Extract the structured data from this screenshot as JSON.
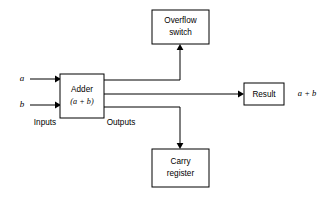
{
  "diagram": {
    "background_color": "#ffffff",
    "line_color": "#000000",
    "nodes": [
      {
        "id": "overflow",
        "name": "overflow-switch-box",
        "label_line1": "Overflow",
        "label_line2": "switch",
        "x": 152,
        "y": 10,
        "width": 57,
        "height": 34
      },
      {
        "id": "adder",
        "name": "adder-box",
        "label_line1": "Adder",
        "label_line2": "(a + b)",
        "x": 60,
        "y": 74,
        "width": 44,
        "height": 44
      },
      {
        "id": "result",
        "name": "result-box",
        "label_line1": "Result",
        "label_line2": "",
        "x": 244,
        "y": 83,
        "width": 40,
        "height": 22
      },
      {
        "id": "carry",
        "name": "carry-register-box",
        "label_line1": "Carry",
        "label_line2": "register",
        "x": 152,
        "y": 149,
        "width": 57,
        "height": 38
      }
    ],
    "input_signals": [
      {
        "id": "a",
        "label": "a",
        "label_x": 22,
        "y": 79,
        "line_start_x": 30,
        "line_end_x": 60
      },
      {
        "id": "b",
        "label": "b",
        "label_x": 22,
        "y": 105,
        "line_start_x": 30,
        "line_end_x": 60
      }
    ],
    "group_labels": [
      {
        "id": "inputs",
        "label": "Inputs",
        "x": 45,
        "y": 123
      },
      {
        "id": "outputs",
        "label": "Outputs",
        "x": 121,
        "y": 123
      }
    ],
    "output_expression": {
      "label": "a + b",
      "x": 307,
      "y": 94
    },
    "wires": [
      {
        "id": "adder-to-overflow",
        "from": "adder",
        "to": "overflow",
        "y": 80,
        "riser_x": 180
      },
      {
        "id": "adder-to-result",
        "from": "adder",
        "to": "result",
        "y": 94
      },
      {
        "id": "adder-to-carry",
        "from": "adder",
        "to": "carry",
        "y": 107,
        "riser_x": 180
      }
    ]
  }
}
